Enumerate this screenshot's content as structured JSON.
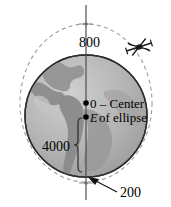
{
  "figure": {
    "labels": {
      "apogee_altitude": "800",
      "perigee_altitude": "200",
      "earth_radius": "4000",
      "center_line_1": "0 – Center",
      "center_line_2": "of ellipse",
      "earth_center_symbol": "E"
    },
    "colors": {
      "ocean": "#b9b9b9",
      "land": "#8f8f8f",
      "globe_outline": "#2a2a2a",
      "orbit_dash": "#9a9a9a",
      "axis_line": "#4a4a4a",
      "text": "#000000",
      "satellite": "#1a1a1a"
    },
    "icons": {
      "satellite": "satellite-icon",
      "center_dot": "point-marker",
      "earth_dot": "point-marker",
      "apogee_dot": "point-marker",
      "perigee_dot": "point-marker"
    },
    "geometry": {
      "globe_center_x": 86,
      "globe_center_y": 116,
      "globe_radius": 61,
      "ellipse_center_x": 86,
      "ellipse_center_y": 103,
      "ellipse_rx": 66,
      "ellipse_ry": 79,
      "axis_top_y": 5,
      "axis_bottom_y": 200
    }
  }
}
